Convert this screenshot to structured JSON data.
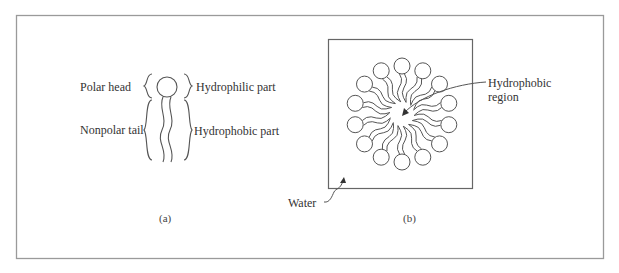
{
  "panel_a": {
    "labels": {
      "polar_head": "Polar head",
      "nonpolar_tail": "Nonpolar tail",
      "hydrophilic_part": "Hydrophilic part",
      "hydrophobic_part": "Hydrophobic part"
    },
    "caption": "(a)"
  },
  "panel_b": {
    "labels": {
      "hydrophobic_region_line1": "Hydrophobic",
      "hydrophobic_region_line2": "region",
      "water": "Water"
    },
    "caption": "(b)",
    "micelle": {
      "head_count": 14
    }
  },
  "colors": {
    "line": "#555555",
    "frame": "#9a9a9a",
    "text": "#333333"
  }
}
